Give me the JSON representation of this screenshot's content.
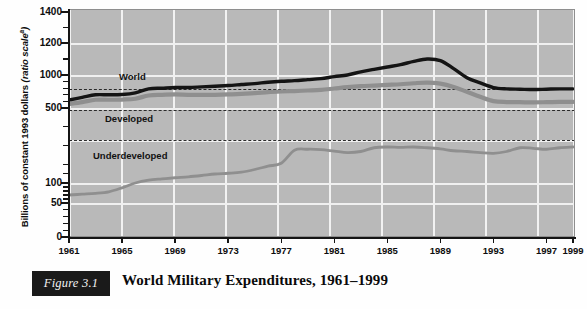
{
  "figure": {
    "number_label": "Figure 3.1",
    "title": "World Military Expenditures, 1961–1999"
  },
  "axes": {
    "ylabel_text": "Billions of constant 1993 dollars ",
    "ylabel_italic": "(ratio scale",
    "ylabel_sup": "a",
    "ylabel_italic_end": ")",
    "y_ticks_major": [
      "1400",
      "1200",
      "1000",
      "500",
      "100",
      "50",
      "0"
    ],
    "x_ticks": [
      "1961",
      "1965",
      "1969",
      "1973",
      "1977",
      "1981",
      "1985",
      "1989",
      "1993",
      "1997",
      "1999"
    ]
  },
  "series_labels": {
    "world": "World",
    "developed": "Developed",
    "underdeveloped": "Underdeveloped"
  },
  "colors": {
    "plot_background": "#b9b9b9",
    "gridline": "#f1f1f1",
    "world_line": "#141414",
    "developed_line": "#8f8f8f",
    "underdeveloped_line": "#8f8f8f",
    "reference_line": "#2a2a2a",
    "axis": "#141414",
    "figure_box": "#1a1a1a",
    "figure_box_text": "#f2f2f2"
  },
  "chart_data": {
    "type": "line",
    "title": "World Military Expenditures, 1961–1999",
    "xlabel": "",
    "ylabel": "Billions of constant 1993 dollars (ratio scale)",
    "scale": "ratio (log-like) scale",
    "grid": true,
    "legend": "inline labels on plot",
    "xlim": [
      1961,
      1999
    ],
    "ylim": [
      0,
      1400
    ],
    "y_tick_values": [
      0,
      50,
      100,
      500,
      1000,
      1200,
      1400
    ],
    "x_tick_values": [
      1961,
      1965,
      1969,
      1973,
      1977,
      1981,
      1985,
      1989,
      1993,
      1997,
      1999
    ],
    "reference_lines": [
      {
        "label": "upper dashed reference",
        "value": 870
      },
      {
        "label": "middle dashed reference",
        "value": 600
      },
      {
        "label": "lower dashed reference",
        "value": 290
      }
    ],
    "x": [
      1961,
      1962,
      1963,
      1964,
      1965,
      1966,
      1967,
      1968,
      1969,
      1970,
      1971,
      1972,
      1973,
      1974,
      1975,
      1976,
      1977,
      1978,
      1979,
      1980,
      1981,
      1982,
      1983,
      1984,
      1985,
      1986,
      1987,
      1988,
      1989,
      1990,
      1991,
      1992,
      1993,
      1994,
      1995,
      1996,
      1997,
      1998,
      1999
    ],
    "series": [
      {
        "name": "World",
        "color": "#141414",
        "style": "solid thick black",
        "values": [
          620,
          660,
          700,
          700,
          705,
          730,
          790,
          800,
          810,
          810,
          820,
          830,
          840,
          855,
          870,
          890,
          905,
          915,
          930,
          945,
          975,
          1000,
          1020,
          1035,
          1050,
          1065,
          1085,
          1100,
          1090,
          1040,
          960,
          880,
          810,
          790,
          785,
          780,
          785,
          790,
          790
        ]
      },
      {
        "name": "Developed",
        "color": "#8f8f8f",
        "style": "solid thick gray",
        "values": [
          560,
          590,
          625,
          625,
          628,
          640,
          690,
          700,
          705,
          700,
          700,
          700,
          705,
          715,
          725,
          740,
          750,
          757,
          765,
          775,
          795,
          815,
          830,
          840,
          850,
          860,
          875,
          885,
          870,
          820,
          745,
          670,
          605,
          590,
          588,
          585,
          588,
          592,
          592
        ]
      },
      {
        "name": "Underdeveloped",
        "color": "#8f8f8f",
        "style": "solid medium gray",
        "values": [
          70,
          72,
          74,
          78,
          88,
          100,
          115,
          122,
          128,
          133,
          140,
          148,
          152,
          158,
          172,
          190,
          205,
          275,
          280,
          278,
          270,
          262,
          268,
          288,
          292,
          290,
          292,
          288,
          282,
          272,
          268,
          262,
          258,
          268,
          288,
          285,
          280,
          288,
          292
        ]
      }
    ]
  }
}
